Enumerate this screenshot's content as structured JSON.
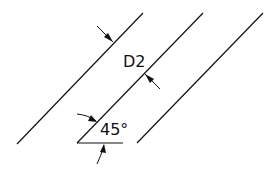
{
  "diagram": {
    "type": "technical-drawing",
    "labels": {
      "spacing": "D2",
      "angle": "45°"
    },
    "colors": {
      "line": "#111111",
      "background": "#ffffff"
    },
    "elements": {
      "parallel_lines": 3,
      "angle_deg": 45,
      "dimension_arrows": 4
    }
  }
}
